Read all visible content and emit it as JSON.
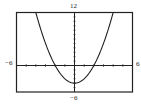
{
  "chart_data": {
    "type": "line",
    "title": "",
    "xlabel": "",
    "ylabel": "",
    "function": "y = x^2 - 4",
    "xlim": [
      -6,
      6
    ],
    "ylim": [
      -6,
      12
    ],
    "x": [
      -4,
      -3,
      -2,
      -1,
      0,
      1,
      2,
      3,
      4
    ],
    "series": [
      {
        "name": "parabola",
        "values": [
          12,
          5,
          0,
          -3,
          -4,
          -3,
          0,
          5,
          12
        ]
      }
    ],
    "grid": false,
    "x_ticks_step": 1,
    "y_ticks_step": 1
  },
  "labels": {
    "xmin": "−6",
    "xmax": "6",
    "ymax": "12",
    "ymin": "−6"
  }
}
